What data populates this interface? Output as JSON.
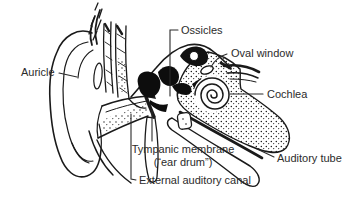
{
  "diagram": {
    "type": "anatomical-line-drawing",
    "labels": {
      "auricle": "Auricle",
      "ossicles": "Ossicles",
      "oval_window": "Oval window",
      "cochlea": "Cochlea",
      "auditory_tube": "Auditory tube",
      "tympanic_membrane_line1": "Tympanic membrane",
      "tympanic_membrane_line2": "(“ear drum”)",
      "external_auditory_canal": "External auditory canal"
    },
    "colors": {
      "ink": "#1a1a1a",
      "background": "#ffffff",
      "label_text": "#2b2b2b"
    }
  }
}
